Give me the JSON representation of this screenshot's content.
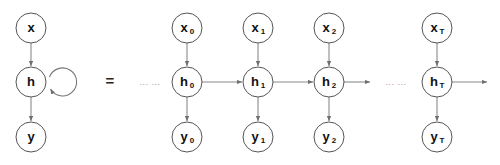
{
  "figure": {
    "type": "diagram",
    "subtype": "recurrent-neural-network-unfolding",
    "background_color": "#ffffff",
    "node_stroke_color": "#555555",
    "edge_color": "#8a8a8a",
    "text_color": "#111111",
    "ellipsis_color": "#9a9a9a"
  },
  "equals": {
    "label": "="
  },
  "folded": {
    "caption": "folded recurrent network",
    "nodes": [
      {
        "id": "x",
        "base": "x",
        "sub": "",
        "cx": 31,
        "cy": 28,
        "r": 15
      },
      {
        "id": "h",
        "base": "h",
        "sub": "",
        "cx": 31,
        "cy": 82,
        "r": 15
      },
      {
        "id": "y",
        "base": "y",
        "sub": "",
        "cx": 31,
        "cy": 137,
        "r": 15
      }
    ],
    "self_loop": {
      "label": "recurrent-self-loop",
      "cx": 62,
      "cy": 81,
      "r": 14
    }
  },
  "unfolded": {
    "caption": "unfolded recurrent network over time",
    "ellipsis_left": "... ...",
    "ellipsis_right": "... ...",
    "ellipsis_left_x": 150,
    "ellipsis_right_x": 396,
    "timesteps": [
      {
        "id": "t0",
        "cx": 187,
        "input": {
          "base": "x",
          "sub": "0"
        },
        "hidden": {
          "base": "h",
          "sub": "0"
        },
        "output": {
          "base": "y",
          "sub": "0"
        }
      },
      {
        "id": "t1",
        "cx": 258,
        "input": {
          "base": "x",
          "sub": "1"
        },
        "hidden": {
          "base": "h",
          "sub": "1"
        },
        "output": {
          "base": "y",
          "sub": "1"
        }
      },
      {
        "id": "t2",
        "cx": 329,
        "input": {
          "base": "x",
          "sub": "2"
        },
        "hidden": {
          "base": "h",
          "sub": "2"
        },
        "output": {
          "base": "y",
          "sub": "2"
        }
      },
      {
        "id": "tT",
        "cx": 437,
        "input": {
          "base": "x",
          "sub": "T"
        },
        "hidden": {
          "base": "h",
          "sub": "T"
        },
        "output": {
          "base": "y",
          "sub": "T"
        }
      }
    ],
    "rows": {
      "input_cy": 28,
      "hidden_cy": 82,
      "output_cy": 137,
      "radius": 15
    }
  }
}
